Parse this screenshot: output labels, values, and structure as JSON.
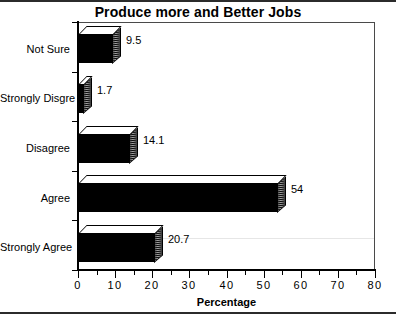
{
  "chart_data": {
    "type": "bar",
    "orientation": "horizontal",
    "title": "Produce more and Better Jobs",
    "xlabel": "Percentage",
    "ylabel": "",
    "categories": [
      "Strongly Agree",
      "Agree",
      "Disagree",
      "Strongly Disgre",
      "Not  Sure"
    ],
    "values": [
      20.7,
      54,
      14.1,
      1.7,
      9.5
    ],
    "value_labels": [
      "20.7",
      "54",
      "14.1",
      "1.7",
      "9.5"
    ],
    "xlim": [
      0,
      80
    ],
    "xticks": [
      0,
      10,
      20,
      30,
      40,
      50,
      60,
      70,
      80
    ],
    "xtick_labels": [
      "0",
      "10",
      "20",
      "30",
      "40",
      "50",
      "60",
      "70",
      "80"
    ],
    "minor_tick_step": 5,
    "grid": false,
    "legend": null,
    "style": "3d-bar",
    "colors": {
      "bar_front": "#000000",
      "bar_top": "#ffffff",
      "bar_side": "#a8a8a8",
      "axis": "#000000",
      "frame": "#4a4a4a",
      "background": "#ffffff",
      "text": "#000000"
    }
  }
}
